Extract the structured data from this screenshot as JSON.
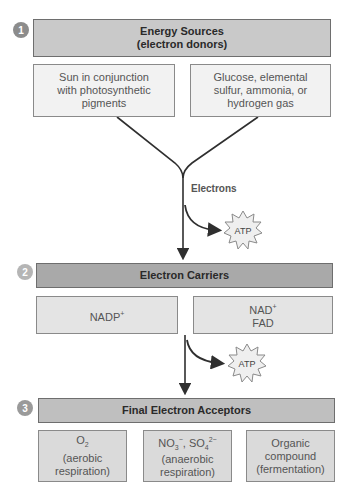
{
  "stage1": {
    "number": "1",
    "title_line1": "Energy Sources",
    "title_line2": "(electron donors)",
    "left": {
      "line1": "Sun in conjunction",
      "line2": "with photosynthetic",
      "line3": "pigments"
    },
    "right": {
      "line1": "Glucose, elemental",
      "line2": "sulfur, ammonia, or",
      "line3": "hydrogen gas"
    }
  },
  "flow1": {
    "label": "Electrons",
    "atp": "ATP"
  },
  "stage2": {
    "number": "2",
    "title": "Electron Carriers",
    "left": {
      "text": "NADP",
      "sup": "+"
    },
    "right": {
      "line1": "NAD",
      "sup": "+",
      "line2": "FAD"
    }
  },
  "flow2": {
    "atp": "ATP"
  },
  "stage3": {
    "number": "3",
    "title": "Final Electron Acceptors",
    "boxes": [
      {
        "formula": "O",
        "sub": "2",
        "line2": "(aerobic",
        "line3": "respiration)"
      },
      {
        "formula_a": "NO",
        "sub_a": "3",
        "sup_a": "−",
        "sep": ", ",
        "formula_b": "SO",
        "sub_b": "4",
        "sup_b": "2−",
        "line2": "(anaerobic",
        "line3": "respiration)"
      },
      {
        "line1": "Organic",
        "line2": "compound",
        "line3": "(fermentation)"
      }
    ]
  },
  "colors": {
    "arrow": "#2f2f2f",
    "atp_fill": "#efefef",
    "atp_stroke": "#8a8a8a"
  }
}
